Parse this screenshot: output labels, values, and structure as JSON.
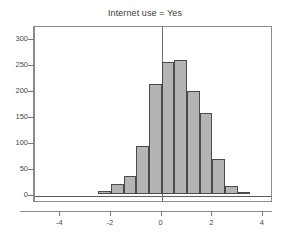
{
  "chart_data": {
    "type": "bar",
    "title": "Internet use = Yes",
    "xlabel": "",
    "ylabel": "",
    "categories": [
      "-2.5",
      "-2.0",
      "-1.5",
      "-1.0",
      "-0.5",
      "0.0",
      "0.5",
      "1.0",
      "1.5",
      "2.0",
      "2.5",
      "3.0"
    ],
    "bin_edges": [
      -2.5,
      -2.0,
      -1.5,
      -1.0,
      -0.5,
      0.0,
      0.5,
      1.0,
      1.5,
      2.0,
      2.5,
      3.0,
      3.5
    ],
    "values": [
      6,
      20,
      34,
      93,
      211,
      254,
      258,
      198,
      155,
      68,
      16,
      2
    ],
    "xlim": [
      -5,
      4.4
    ],
    "ylim": [
      0,
      310
    ],
    "y_ticks": [
      0,
      50,
      100,
      150,
      200,
      250,
      300
    ],
    "y_tick_labels": [
      "0",
      "50",
      "100",
      "150",
      "200",
      "250",
      "300"
    ],
    "x_ticks": [
      -4,
      -2,
      0,
      2,
      4
    ],
    "x_tick_labels": [
      "-4",
      "-2",
      "0",
      "2",
      "4"
    ],
    "grid": false,
    "legend": false,
    "reference_line_x": 0,
    "colors": {
      "bar_fill": "#b4b4b4",
      "bar_edge": "#4a4a4a",
      "axis": "#8c8c8c",
      "text": "#4a4a4a",
      "reference_line": "#6e6e6e",
      "background": "#ffffff"
    }
  }
}
